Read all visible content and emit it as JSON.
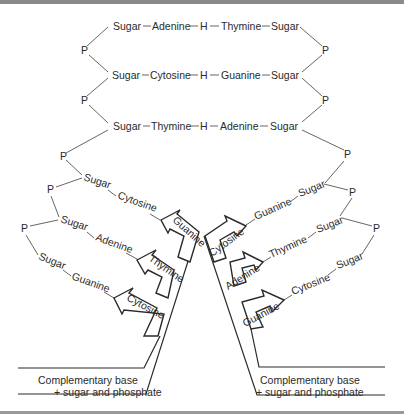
{
  "diagram": {
    "double_helix_rows": [
      {
        "left_sugar": "Sugar",
        "left_base": "Adenine",
        "bond": "H",
        "right_base": "Thymine",
        "right_sugar": "Sugar"
      },
      {
        "left_sugar": "Sugar",
        "left_base": "Cytosine",
        "bond": "H",
        "right_base": "Guanine",
        "right_sugar": "Sugar"
      },
      {
        "left_sugar": "Sugar",
        "left_base": "Thymine",
        "bond": "H",
        "right_base": "Adenine",
        "right_sugar": "Sugar"
      }
    ],
    "phosphate_label": "P",
    "left_strand": [
      {
        "sugar": "Sugar",
        "base": "Cytosine",
        "incoming": "Guanine"
      },
      {
        "sugar": "Sugar",
        "base": "Adenine",
        "incoming": "Thymine"
      },
      {
        "sugar": "Sugar",
        "base": "Guanine",
        "incoming": "Cytosine"
      }
    ],
    "right_strand": [
      {
        "sugar": "Sugar",
        "base": "Guanine",
        "incoming": "Cytosine"
      },
      {
        "sugar": "Sugar",
        "base": "Thymine",
        "incoming": "Adenine"
      },
      {
        "sugar": "Sugar",
        "base": "Cytosine",
        "incoming": "Guanine"
      }
    ],
    "source_label": {
      "line1": "Complementary base",
      "line2": "+ sugar and phosphate"
    },
    "colors": {
      "ink": "#2a2a2a",
      "frame": "#8a8a8a",
      "background": "#ffffff"
    }
  }
}
